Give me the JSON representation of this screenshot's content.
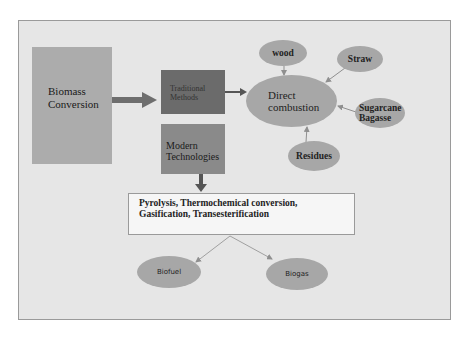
{
  "diagram": {
    "nodes": {
      "biomass": "Biomass\nConversion",
      "traditional": "Traditional\nMethods",
      "modern": "Modern\nTechnologies",
      "direct": "Direct\ncombustion",
      "wood": "wood",
      "straw": "Straw",
      "sugarcane": "Sugarcane\nBagasse",
      "residues": "Residues",
      "process": "Pyrolysis, Thermochemical conversion,\nGasification, Transesterification",
      "biofuel": "Biofuel",
      "biogas": "Biogas"
    },
    "edges": [
      {
        "from": "biomass",
        "to": "traditional"
      },
      {
        "from": "traditional",
        "to": "direct"
      },
      {
        "from": "wood",
        "to": "direct"
      },
      {
        "from": "straw",
        "to": "direct"
      },
      {
        "from": "sugarcane",
        "to": "direct"
      },
      {
        "from": "residues",
        "to": "direct"
      },
      {
        "from": "modern",
        "to": "process"
      },
      {
        "from": "process",
        "to": "biofuel"
      },
      {
        "from": "process",
        "to": "biogas"
      }
    ],
    "colors": {
      "frame_bg": "#e6e6e6",
      "biomass_box": "#acacac",
      "traditional_box": "#6b6b6b",
      "modern_box": "#8a8a8a",
      "ellipse": "#a7a7a7",
      "arrow": "#6e6e6e"
    }
  }
}
